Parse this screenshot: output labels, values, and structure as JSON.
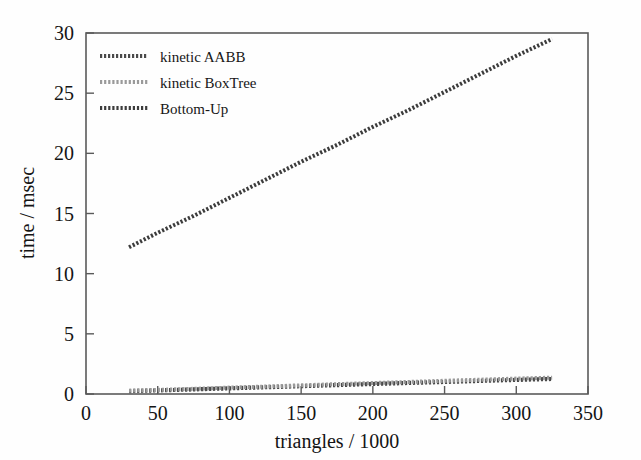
{
  "chart_data": {
    "type": "line",
    "title": "",
    "xlabel": "triangles / 1000",
    "ylabel": "time / msec",
    "xlim": [
      0,
      350
    ],
    "ylim": [
      0,
      30
    ],
    "xticks": [
      0,
      50,
      100,
      150,
      200,
      250,
      300,
      350
    ],
    "yticks": [
      0,
      5,
      10,
      15,
      20,
      25,
      30
    ],
    "grid": false,
    "legend_position": "upper left",
    "series": [
      {
        "name": "kinetic AABB",
        "color": "#4a4a4a",
        "style": "dotted-thick",
        "x": [
          30,
          50,
          75,
          100,
          125,
          150,
          175,
          200,
          225,
          250,
          275,
          300,
          325
        ],
        "values": [
          0.24,
          0.3,
          0.38,
          0.47,
          0.56,
          0.65,
          0.74,
          0.83,
          0.92,
          1.0,
          1.09,
          1.17,
          1.25
        ]
      },
      {
        "name": "kinetic BoxTree",
        "color": "#9a9a9a",
        "style": "dotted",
        "x": [
          30,
          50,
          75,
          100,
          125,
          150,
          175,
          200,
          225,
          250,
          275,
          300,
          325
        ],
        "values": [
          0.28,
          0.34,
          0.43,
          0.53,
          0.62,
          0.72,
          0.82,
          0.91,
          1.0,
          1.1,
          1.19,
          1.28,
          1.36
        ]
      },
      {
        "name": "Bottom-Up",
        "color": "#3c3c3c",
        "style": "dotted",
        "x": [
          30,
          50,
          75,
          100,
          125,
          150,
          175,
          200,
          225,
          250,
          275,
          300,
          325
        ],
        "values": [
          12.2,
          13.4,
          14.8,
          16.3,
          17.8,
          19.3,
          20.7,
          22.2,
          23.6,
          25.1,
          26.6,
          28.1,
          29.5
        ]
      }
    ]
  },
  "axes": {
    "x_title": "triangles / 1000",
    "y_title": "time / msec",
    "x_tick_labels": [
      "0",
      "50",
      "100",
      "150",
      "200",
      "250",
      "300",
      "350"
    ],
    "y_tick_labels": [
      "0",
      "5",
      "10",
      "15",
      "20",
      "25",
      "30"
    ]
  },
  "legend": {
    "entries": [
      {
        "label": "kinetic AABB",
        "color": "#4a4a4a"
      },
      {
        "label": "kinetic BoxTree",
        "color": "#9a9a9a"
      },
      {
        "label": "Bottom-Up",
        "color": "#3c3c3c"
      }
    ]
  }
}
